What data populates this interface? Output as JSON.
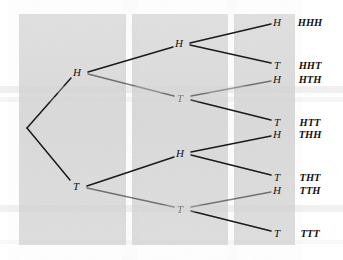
{
  "figure": {
    "background_color": "#ffffff",
    "panel_color": "#dcdcdc",
    "panel_color_light": "#e2e2e2",
    "stripe_color": "#ffffff",
    "line_color": "#1a1a1a",
    "text_color": "#111111"
  },
  "panels": [
    {
      "name": "panel-stage-one",
      "x": 19,
      "y": 14,
      "width": 107,
      "height": 231
    },
    {
      "name": "panel-stage-two",
      "x": 132,
      "y": 14,
      "width": 96,
      "height": 231
    },
    {
      "name": "panel-stage-three",
      "x": 234,
      "y": 14,
      "width": 61,
      "height": 231
    }
  ],
  "scan_bands": [
    {
      "name": "scan-band-upper",
      "y": 86,
      "height": 7,
      "opacity": 0.34
    },
    {
      "name": "scan-band-upper-faint",
      "y": 97,
      "height": 5,
      "opacity": 0.2
    },
    {
      "name": "scan-band-lower",
      "y": 205,
      "height": 7,
      "opacity": 0.3
    },
    {
      "name": "scan-band-bottom",
      "y": 240,
      "height": 4,
      "opacity": 0.16
    }
  ],
  "nodes": {
    "root": {
      "label": "",
      "x": 27,
      "y": 128
    },
    "level1": [
      {
        "name": "node-h",
        "label": "H",
        "x": 77,
        "y": 72,
        "branch_x": 88
      },
      {
        "name": "node-t",
        "label": "T",
        "x": 76,
        "y": 186,
        "branch_x": 87
      }
    ],
    "level2": [
      {
        "name": "node-hh",
        "label": "H",
        "x": 179,
        "y": 43,
        "branch_x": 190,
        "faded": false
      },
      {
        "name": "node-ht",
        "label": "T",
        "x": 180,
        "y": 98,
        "branch_x": 191,
        "faded": true
      },
      {
        "name": "node-th",
        "label": "H",
        "x": 180,
        "y": 153,
        "branch_x": 191,
        "faded": false
      },
      {
        "name": "node-tt",
        "label": "T",
        "x": 180,
        "y": 209,
        "branch_x": 191,
        "faded": true
      }
    ],
    "level3": [
      {
        "name": "leaf-hhh",
        "label": "H",
        "x": 277,
        "y": 22
      },
      {
        "name": "leaf-hht",
        "label": "T",
        "x": 277,
        "y": 65
      },
      {
        "name": "leaf-hth",
        "label": "H",
        "x": 277,
        "y": 79
      },
      {
        "name": "leaf-htt",
        "label": "T",
        "x": 277,
        "y": 122
      },
      {
        "name": "leaf-thh",
        "label": "H",
        "x": 277,
        "y": 134
      },
      {
        "name": "leaf-tht",
        "label": "T",
        "x": 277,
        "y": 177
      },
      {
        "name": "leaf-tth",
        "label": "H",
        "x": 277,
        "y": 190
      },
      {
        "name": "leaf-ttt",
        "label": "T",
        "x": 277,
        "y": 233
      }
    ]
  },
  "outcomes": [
    {
      "name": "outcome-hhh",
      "label": "HHH",
      "x": 310,
      "y": 22
    },
    {
      "name": "outcome-hht",
      "label": "HHT",
      "x": 310,
      "y": 65
    },
    {
      "name": "outcome-hth",
      "label": "HTH",
      "x": 310,
      "y": 79
    },
    {
      "name": "outcome-htt",
      "label": "HTT",
      "x": 310,
      "y": 122
    },
    {
      "name": "outcome-thh",
      "label": "THH",
      "x": 310,
      "y": 134
    },
    {
      "name": "outcome-tht",
      "label": "THT",
      "x": 310,
      "y": 177
    },
    {
      "name": "outcome-tth",
      "label": "TTH",
      "x": 310,
      "y": 190
    },
    {
      "name": "outcome-ttt",
      "label": "TTT",
      "x": 310,
      "y": 233
    }
  ],
  "edges": [
    {
      "name": "edge-root-h",
      "x1": 27,
      "y1": 128,
      "x2": 71,
      "y2": 78,
      "faded": false
    },
    {
      "name": "edge-root-t",
      "x1": 27,
      "y1": 128,
      "x2": 70,
      "y2": 180,
      "faded": false
    },
    {
      "name": "edge-h-hh",
      "x1": 88,
      "y1": 72,
      "x2": 173,
      "y2": 47,
      "faded": false
    },
    {
      "name": "edge-h-ht",
      "x1": 88,
      "y1": 74,
      "x2": 174,
      "y2": 96,
      "faded": true
    },
    {
      "name": "edge-t-th",
      "x1": 87,
      "y1": 186,
      "x2": 174,
      "y2": 157,
      "faded": false
    },
    {
      "name": "edge-t-tt",
      "x1": 87,
      "y1": 188,
      "x2": 174,
      "y2": 207,
      "faded": true
    },
    {
      "name": "edge-hh-hhh",
      "x1": 190,
      "y1": 43,
      "x2": 271,
      "y2": 24,
      "faded": false
    },
    {
      "name": "edge-hh-hht",
      "x1": 190,
      "y1": 45,
      "x2": 271,
      "y2": 63,
      "faded": false
    },
    {
      "name": "edge-ht-hth",
      "x1": 191,
      "y1": 96,
      "x2": 271,
      "y2": 81,
      "faded": true
    },
    {
      "name": "edge-ht-htt",
      "x1": 191,
      "y1": 100,
      "x2": 271,
      "y2": 120,
      "faded": false
    },
    {
      "name": "edge-th-thh",
      "x1": 191,
      "y1": 152,
      "x2": 271,
      "y2": 136,
      "faded": false
    },
    {
      "name": "edge-th-tht",
      "x1": 191,
      "y1": 155,
      "x2": 271,
      "y2": 175,
      "faded": false
    },
    {
      "name": "edge-tt-tth",
      "x1": 191,
      "y1": 207,
      "x2": 271,
      "y2": 192,
      "faded": true
    },
    {
      "name": "edge-tt-ttt",
      "x1": 191,
      "y1": 211,
      "x2": 271,
      "y2": 231,
      "faded": false
    }
  ]
}
